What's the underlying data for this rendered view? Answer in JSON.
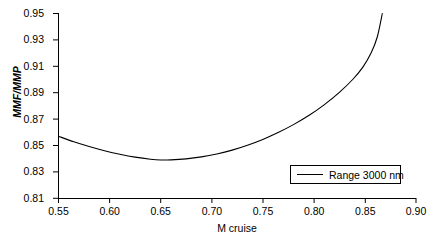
{
  "chart_data": {
    "type": "line",
    "title": "",
    "xlabel": "M cruise",
    "ylabel": "MMF/MMP",
    "xlim": [
      0.55,
      0.9
    ],
    "ylim": [
      0.81,
      0.95
    ],
    "xticks": [
      "0.55",
      "0.60",
      "0.65",
      "0.70",
      "0.75",
      "0.80",
      "0.85",
      "0.90"
    ],
    "yticks": [
      "0.95",
      "0.93",
      "0.91",
      "0.89",
      "0.87",
      "0.85",
      "0.83",
      "0.81"
    ],
    "xtick_values": [
      0.55,
      0.6,
      0.65,
      0.7,
      0.75,
      0.8,
      0.85,
      0.9
    ],
    "ytick_values": [
      0.95,
      0.93,
      0.91,
      0.89,
      0.87,
      0.85,
      0.83,
      0.81
    ],
    "grid": false,
    "legend_position": "lower right",
    "series": [
      {
        "name": "Range 3000 nm",
        "color": "#000000",
        "x": [
          0.55,
          0.565,
          0.58,
          0.595,
          0.61,
          0.625,
          0.64,
          0.65,
          0.66,
          0.675,
          0.69,
          0.705,
          0.72,
          0.735,
          0.75,
          0.765,
          0.78,
          0.795,
          0.81,
          0.825,
          0.838,
          0.848,
          0.856,
          0.862,
          0.867
        ],
        "y": [
          0.857,
          0.8528,
          0.8492,
          0.846,
          0.8434,
          0.8412,
          0.8396,
          0.839,
          0.8391,
          0.8399,
          0.8414,
          0.8436,
          0.8465,
          0.8502,
          0.8546,
          0.8598,
          0.8658,
          0.8727,
          0.8808,
          0.8903,
          0.9,
          0.9094,
          0.92,
          0.932,
          0.95
        ]
      }
    ],
    "annotations": []
  },
  "legend": {
    "entries": [
      {
        "label": "Range 3000 nm"
      }
    ]
  },
  "axes": {
    "x_title": "M cruise",
    "y_title": "MMF/MMP"
  }
}
